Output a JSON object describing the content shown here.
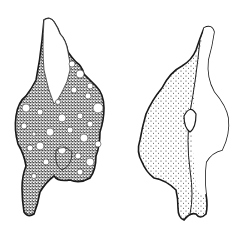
{
  "figure": {
    "views": [
      {
        "label": "left view (dark, pitted surface)"
      },
      {
        "label": "right view (lightly stippled with central keel)"
      }
    ],
    "colors": {
      "ink": "#1a1a1a",
      "paper": "#ffffff"
    }
  }
}
